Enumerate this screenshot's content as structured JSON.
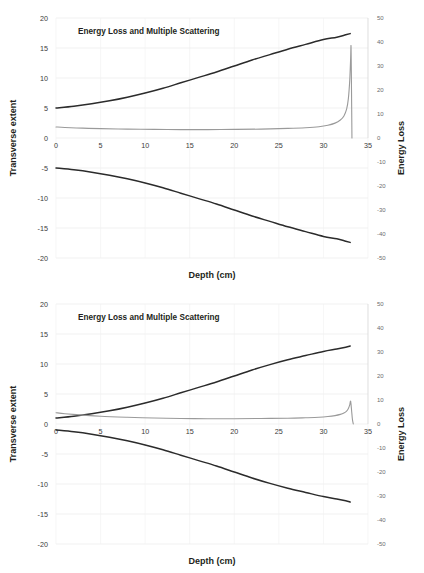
{
  "chart_data": [
    {
      "type": "line",
      "panel": "top",
      "title": "Energy Loss and Multiple Scattering",
      "xlabel": "Depth (cm)",
      "ylabel": "Transverse extent",
      "y2label": "Energy Loss",
      "xlim": [
        0,
        35
      ],
      "ylim": [
        -20,
        20
      ],
      "y2lim": [
        -50,
        50
      ],
      "xticks": [
        0,
        5,
        10,
        15,
        20,
        25,
        30,
        35
      ],
      "yticks": [
        20,
        15,
        10,
        5,
        0,
        -5,
        -10,
        -15,
        -20
      ],
      "y2ticks": [
        50,
        40,
        30,
        20,
        10,
        0,
        -10,
        -20,
        -30,
        -40,
        -50
      ],
      "grid": true,
      "legend": "none",
      "series": [
        {
          "name": "beam-envelope-upper",
          "axis": "left",
          "color": "#2b2b2b",
          "x": [
            0,
            2,
            4,
            6,
            8,
            10,
            12,
            14,
            16,
            18,
            20,
            22,
            24,
            26,
            28,
            30,
            31.5,
            32.5,
            33
          ],
          "values": [
            5.0,
            5.3,
            5.7,
            6.2,
            6.8,
            7.5,
            8.3,
            9.2,
            10.1,
            11.0,
            12.0,
            13.0,
            13.9,
            14.8,
            15.6,
            16.4,
            16.8,
            17.2,
            17.4
          ]
        },
        {
          "name": "beam-envelope-lower",
          "axis": "left",
          "color": "#2b2b2b",
          "x": [
            0,
            2,
            4,
            6,
            8,
            10,
            12,
            14,
            16,
            18,
            20,
            22,
            24,
            26,
            28,
            30,
            31.5,
            32.5,
            33
          ],
          "values": [
            -5.0,
            -5.3,
            -5.7,
            -6.2,
            -6.8,
            -7.5,
            -8.3,
            -9.2,
            -10.1,
            -11.0,
            -12.0,
            -13.0,
            -13.9,
            -14.8,
            -15.6,
            -16.4,
            -16.8,
            -17.2,
            -17.4
          ]
        },
        {
          "name": "energy-loss-bragg-curve",
          "axis": "right",
          "color": "#9a9a9a",
          "x": [
            0,
            1,
            3,
            5,
            8,
            11,
            14,
            17,
            20,
            23,
            26,
            28,
            29.5,
            30.5,
            31.3,
            31.9,
            32.3,
            32.6,
            32.8,
            32.95,
            33.05,
            33.1,
            33.15,
            33.2
          ],
          "values": [
            4.6,
            4.4,
            4.1,
            3.9,
            3.7,
            3.6,
            3.5,
            3.5,
            3.6,
            3.7,
            4.0,
            4.3,
            4.7,
            5.3,
            6.2,
            7.5,
            9.2,
            12.0,
            16.5,
            24.0,
            33.0,
            38.0,
            20.0,
            0.0
          ]
        }
      ]
    },
    {
      "type": "line",
      "panel": "bottom",
      "title": "Energy Loss and Multiple Scattering",
      "xlabel": "Depth (cm)",
      "ylabel": "Transverse extent",
      "y2label": "Energy Loss",
      "xlim": [
        0,
        35
      ],
      "ylim": [
        -20,
        20
      ],
      "y2lim": [
        -50,
        50
      ],
      "xticks": [
        0,
        5,
        10,
        15,
        20,
        25,
        30,
        35
      ],
      "yticks": [
        20,
        15,
        10,
        5,
        0,
        -5,
        -10,
        -15,
        -20
      ],
      "y2ticks": [
        50,
        40,
        30,
        20,
        10,
        0,
        -10,
        -20,
        -30,
        -40,
        -50
      ],
      "grid": true,
      "legend": "none",
      "series": [
        {
          "name": "beam-envelope-upper",
          "axis": "left",
          "color": "#2b2b2b",
          "x": [
            0,
            2,
            4,
            6,
            8,
            10,
            12,
            14,
            16,
            18,
            20,
            22,
            24,
            26,
            28,
            30,
            31.5,
            32.5,
            33
          ],
          "values": [
            1.0,
            1.3,
            1.7,
            2.2,
            2.8,
            3.5,
            4.3,
            5.2,
            6.1,
            7.0,
            8.0,
            9.0,
            9.9,
            10.7,
            11.4,
            12.1,
            12.5,
            12.8,
            13.0
          ]
        },
        {
          "name": "beam-envelope-lower",
          "axis": "left",
          "color": "#2b2b2b",
          "x": [
            0,
            2,
            4,
            6,
            8,
            10,
            12,
            14,
            16,
            18,
            20,
            22,
            24,
            26,
            28,
            30,
            31.5,
            32.5,
            33
          ],
          "values": [
            -1.0,
            -1.3,
            -1.7,
            -2.2,
            -2.8,
            -3.5,
            -4.3,
            -5.2,
            -6.1,
            -7.0,
            -8.0,
            -9.0,
            -9.9,
            -10.7,
            -11.4,
            -12.1,
            -12.5,
            -12.8,
            -13.0
          ]
        },
        {
          "name": "energy-loss-bragg-curve",
          "axis": "right",
          "color": "#9a9a9a",
          "x": [
            0,
            1,
            3,
            5,
            8,
            11,
            14,
            17,
            20,
            23,
            26,
            28,
            29.5,
            30.5,
            31.3,
            31.9,
            32.3,
            32.6,
            32.8,
            32.95,
            33.05,
            33.15,
            33.25,
            33.35
          ],
          "values": [
            4.7,
            4.3,
            3.7,
            3.2,
            2.8,
            2.5,
            2.3,
            2.2,
            2.2,
            2.3,
            2.4,
            2.6,
            2.8,
            3.1,
            3.5,
            4.0,
            4.6,
            5.4,
            6.5,
            8.0,
            9.5,
            6.0,
            2.0,
            0.0
          ]
        }
      ]
    }
  ]
}
